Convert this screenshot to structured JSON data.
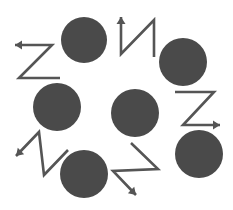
{
  "diagram": {
    "colors": {
      "background": "#ffffff",
      "circle": "#4a4a4a",
      "arrow": "#555555"
    },
    "circles": [
      {
        "id": "top",
        "cx": 84,
        "cy": 40,
        "r": 23
      },
      {
        "id": "upper-right",
        "cx": 183,
        "cy": 62,
        "r": 24
      },
      {
        "id": "lower-right",
        "cx": 199,
        "cy": 154,
        "r": 24
      },
      {
        "id": "center",
        "cx": 135,
        "cy": 113,
        "r": 24
      },
      {
        "id": "left",
        "cx": 57,
        "cy": 107,
        "r": 24
      },
      {
        "id": "bottom",
        "cx": 84,
        "cy": 174,
        "r": 24
      }
    ],
    "arrows": [
      {
        "id": "zigzag-top-left",
        "shape": "Z",
        "direction": "left",
        "points": "60,78 19,78 52,45 15,45",
        "head": [
          15,
          45
        ],
        "angle": 180
      },
      {
        "id": "zigzag-top",
        "shape": "N",
        "direction": "up",
        "points": "154,57 154,20 121,54 121,17",
        "head": [
          121,
          17
        ],
        "angle": 270
      },
      {
        "id": "zigzag-right",
        "shape": "Z",
        "direction": "right",
        "points": "175,92 214,92 183,125 220,125",
        "head": [
          220,
          125
        ],
        "angle": 0
      },
      {
        "id": "zigzag-bottom",
        "shape": "Z",
        "direction": "down-right",
        "points": "131,143 158,169 113,171 136,195",
        "head": [
          136,
          195
        ],
        "angle": 45
      },
      {
        "id": "zigzag-left",
        "shape": "N",
        "direction": "down-left",
        "points": "68,150 44,175 39,132 16,156",
        "head": [
          16,
          156
        ],
        "angle": 135
      }
    ]
  }
}
